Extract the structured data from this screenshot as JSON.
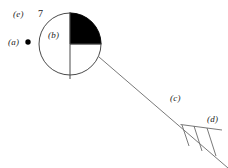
{
  "figure": {
    "background_color": "#ffffff",
    "stroke_color": "#3a3a3a",
    "fill_color": "#000000",
    "width": 228,
    "height": 168
  },
  "labels": {
    "e": "(e)",
    "seven": "7",
    "a": "(a)",
    "b": "(b)",
    "c": "(c)",
    "d": "(d)"
  },
  "elements": {
    "marker_dot": {
      "name": "filled-dot-marker",
      "cx": 28,
      "cy": 42,
      "r": 2.6,
      "color": "#000000"
    },
    "circle": {
      "name": "main-circle",
      "cx": 70,
      "cy": 44,
      "r": 31,
      "stroke": "#4a4a4a",
      "fill": "#ffffff"
    },
    "filled_quadrant": {
      "name": "upper-right-quadrant",
      "quadrant": "upper-right",
      "fill": "#000000"
    },
    "vertical_divider": {
      "name": "vertical-divider-line",
      "x": 70,
      "y1": 13,
      "y2": 79
    },
    "horizontal_divider": {
      "name": "horizontal-divider-line",
      "y": 44,
      "x1": 70,
      "x2": 101
    },
    "diagonal_line": {
      "name": "diagonal-connector-line",
      "x1": 99,
      "y1": 57,
      "x2": 228,
      "y2": 168
    },
    "hatch_base": {
      "name": "hatch-base-line",
      "x1": 181,
      "y1": 125,
      "x2": 222,
      "y2": 130
    },
    "hatch_strokes": {
      "name": "hatch-strokes",
      "count": 3
    }
  }
}
